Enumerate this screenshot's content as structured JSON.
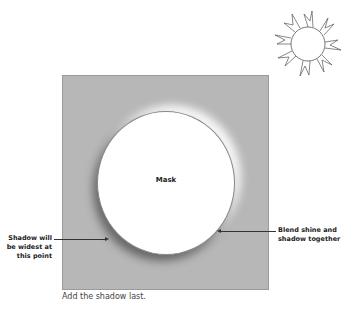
{
  "diagram": {
    "mask_label": "Mask",
    "callouts": {
      "left": [
        "Shadow will",
        "be widest at",
        "this point"
      ],
      "right": [
        "Blend shine and",
        "shadow together"
      ]
    },
    "caption": "Add the shadow last.",
    "icons": [
      "sun-icon"
    ],
    "colors": {
      "panel": "#b7b7b7",
      "circle": "#ffffff",
      "text": "#222222"
    }
  }
}
